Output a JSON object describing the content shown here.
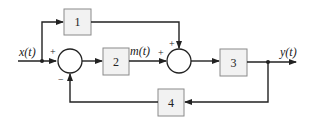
{
  "diagram": {
    "type": "block-diagram",
    "signals": {
      "input": "x(t)",
      "intermediate": "m(t)",
      "output": "y(t)"
    },
    "blocks": [
      {
        "id": "1",
        "label": "1"
      },
      {
        "id": "2",
        "label": "2"
      },
      {
        "id": "3",
        "label": "3"
      },
      {
        "id": "4",
        "label": "4"
      }
    ],
    "summing_junctions": [
      {
        "id": "sum1",
        "signs": {
          "left": "+",
          "bottom": "−"
        }
      },
      {
        "id": "sum2",
        "signs": {
          "left": "+",
          "top": "+"
        }
      }
    ],
    "connections": [
      "x(t) → sum1 (+)",
      "x(t) → block 1",
      "block 1 → sum2 (+ top)",
      "sum1 → block 2",
      "block 2 → m(t) → sum2 (+ left)",
      "sum2 → block 3",
      "block 3 → y(t)",
      "y(t) → block 4",
      "block 4 → sum1 (− bottom)"
    ],
    "colors": {
      "line": "#222222",
      "block_fill": "#f2f2f2",
      "block_border": "#8a8a8a",
      "background": "#ffffff"
    }
  }
}
